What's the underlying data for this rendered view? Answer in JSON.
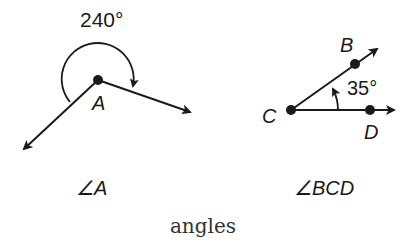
{
  "figure": {
    "caption": "angles",
    "angle_a": {
      "vertex_label": "A",
      "measure_label": "240°",
      "name_label": "∠A"
    },
    "angle_bcd": {
      "vertex_label": "C",
      "point_b_label": "B",
      "point_d_label": "D",
      "measure_label": "35°",
      "name_label": "∠BCD"
    }
  },
  "colors": {
    "stroke": "#1a1a1a",
    "background": "#ffffff"
  }
}
